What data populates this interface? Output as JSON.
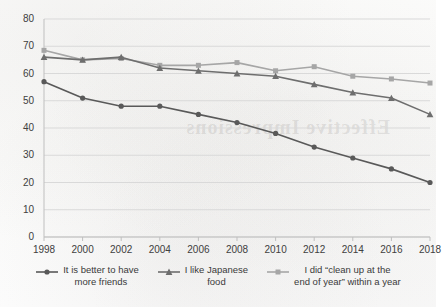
{
  "chart_data": {
    "type": "line",
    "title": "",
    "subtitle": "",
    "xlabel": "",
    "ylabel": "",
    "x": [
      1998,
      2000,
      2002,
      2004,
      2006,
      2008,
      2010,
      2012,
      2014,
      2016,
      2018
    ],
    "xtick_labels": [
      "1998",
      "2000",
      "2002",
      "2004",
      "2006",
      "2008",
      "2010",
      "2012",
      "2014",
      "2016",
      "2018"
    ],
    "ytick_labels": [
      "0",
      "10",
      "20",
      "30",
      "40",
      "50",
      "60",
      "70",
      "80"
    ],
    "yticks": [
      0,
      10,
      20,
      30,
      40,
      50,
      60,
      70,
      80
    ],
    "ylim": [
      0,
      80
    ],
    "xlim": [
      1998,
      2018
    ],
    "grid": "horizontal",
    "legend_position": "bottom",
    "series": [
      {
        "name": "It is better to have more friends",
        "legend_label": "It is better to have\nmore friends",
        "marker": "circle",
        "color": "#595959",
        "values": [
          57,
          51,
          48,
          48,
          45,
          42,
          38,
          33,
          29,
          25,
          20
        ]
      },
      {
        "name": "I like Japanese food",
        "legend_label": "I like Japanese\nfood",
        "marker": "triangle",
        "color": "#6e6e6e",
        "values": [
          66,
          65,
          66,
          62,
          61,
          60,
          59,
          56,
          53,
          51,
          45
        ]
      },
      {
        "name": "I did \"clean up at the end of year\" within a year",
        "legend_label": "I did “clean up at the\nend of year” within a year",
        "marker": "square",
        "color": "#a6a6a6",
        "values": [
          68.5,
          65,
          65.5,
          63,
          63,
          64,
          61,
          62.5,
          59,
          58,
          56.5
        ]
      }
    ],
    "colors": {
      "gridline": "#d9d9d9",
      "axis": "#bfbfbf",
      "tick_text": "#404040",
      "background": "#fdfdfc"
    }
  },
  "bleedthrough_text": "Effective  Impressions"
}
